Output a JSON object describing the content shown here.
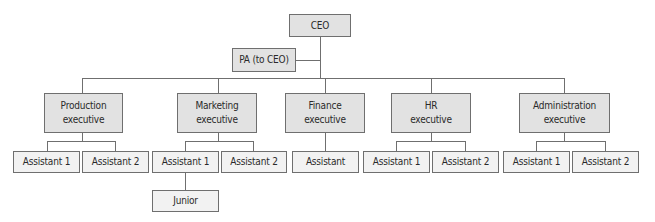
{
  "chart": {
    "ceo": {
      "label": "CEO"
    },
    "pa": {
      "label": "PA (to CEO)"
    },
    "executives": [
      {
        "id": "production",
        "line1": "Production",
        "line2": "executive",
        "reports": [
          {
            "label": "Assistant 1"
          },
          {
            "label": "Assistant 2"
          }
        ]
      },
      {
        "id": "marketing",
        "line1": "Marketing",
        "line2": "executive",
        "reports": [
          {
            "label": "Assistant 1",
            "reports": [
              {
                "label": "Junior"
              }
            ]
          },
          {
            "label": "Assistant 2"
          }
        ]
      },
      {
        "id": "finance",
        "line1": "Finance",
        "line2": "executive",
        "reports": [
          {
            "label": "Assistant"
          }
        ]
      },
      {
        "id": "hr",
        "line1": "HR",
        "line2": "executive",
        "reports": [
          {
            "label": "Assistant 1"
          },
          {
            "label": "Assistant 2"
          }
        ]
      },
      {
        "id": "administration",
        "line1": "Administration",
        "line2": "executive",
        "reports": [
          {
            "label": "Assistant 1"
          },
          {
            "label": "Assistant 2"
          }
        ]
      }
    ],
    "colors": {
      "senior_fill": "#e2e2e2",
      "assistant_fill": "#f2f2f2",
      "border": "#6f6f6f",
      "text": "#2a2a2a"
    }
  }
}
